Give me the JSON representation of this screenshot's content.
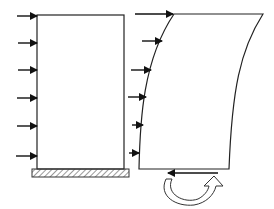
{
  "diagram": {
    "title": "",
    "colors": {
      "line": "#222222",
      "arrow": "#111111",
      "hatch": "#555555",
      "background": "#ffffff"
    },
    "left_wall": {
      "label": "",
      "x": 37,
      "top": 15,
      "right": 124,
      "bottom": 169,
      "loads_y": [
        16,
        43,
        70,
        98,
        126,
        156
      ],
      "support": {
        "type": "fixed-base-hatched",
        "x": 32,
        "y": 169,
        "w": 97,
        "h": 8
      }
    },
    "right_wall": {
      "label": "",
      "loads": [
        {
          "x1": 135,
          "y": 14,
          "x2": 173
        },
        {
          "x1": 142,
          "y": 41,
          "x2": 162
        },
        {
          "x1": 131,
          "y": 70,
          "x2": 151
        },
        {
          "x1": 128,
          "y": 97,
          "x2": 146
        },
        {
          "x1": 132,
          "y": 125,
          "x2": 143
        },
        {
          "x1": 129,
          "y": 153,
          "x2": 139
        }
      ],
      "base_shear_arrow": {
        "x1": 218,
        "y": 173,
        "x2": 168
      },
      "overturning_moment": "curved-arrow-clockwise"
    }
  }
}
